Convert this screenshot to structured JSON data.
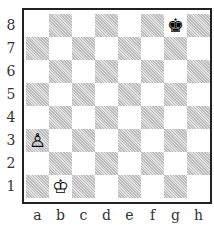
{
  "board": {
    "ranks": [
      "8",
      "7",
      "6",
      "5",
      "4",
      "3",
      "2",
      "1"
    ],
    "files": [
      "a",
      "b",
      "c",
      "d",
      "e",
      "f",
      "g",
      "h"
    ],
    "pieces": [
      {
        "square": "g8",
        "piece": "black-king",
        "glyph": "♚"
      },
      {
        "square": "a3",
        "piece": "white-pawn",
        "glyph": "♙"
      },
      {
        "square": "b1",
        "piece": "white-king",
        "glyph": "♔"
      }
    ]
  }
}
